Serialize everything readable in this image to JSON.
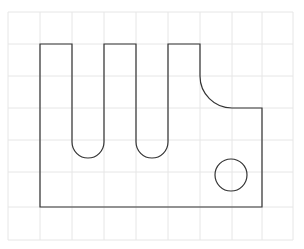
{
  "canvas": {
    "width": 304,
    "height": 249,
    "background": "#ffffff"
  },
  "grid": {
    "color": "#e6e6e6",
    "x_lines": [
      8,
      40,
      72,
      104,
      136,
      168,
      200,
      232,
      262,
      293
    ],
    "y_lines": [
      12,
      44,
      76,
      108,
      140,
      172,
      207,
      240
    ],
    "x_min": 8,
    "x_max": 293,
    "y_min": 12,
    "y_max": 240
  },
  "part": {
    "stroke": "#333333",
    "outline_path": "M40,44 L72,44 L72,142 A16,16 0 0 0 104,142 L104,44 L136,44 L136,142 A16,16 0 0 0 168,142 L168,44 L200,44 L200,76 A32,32 0 0 0 232,108 L262,108 L262,207 L40,207 Z",
    "hole": {
      "cx": 231,
      "cy": 175,
      "r": 16
    }
  }
}
